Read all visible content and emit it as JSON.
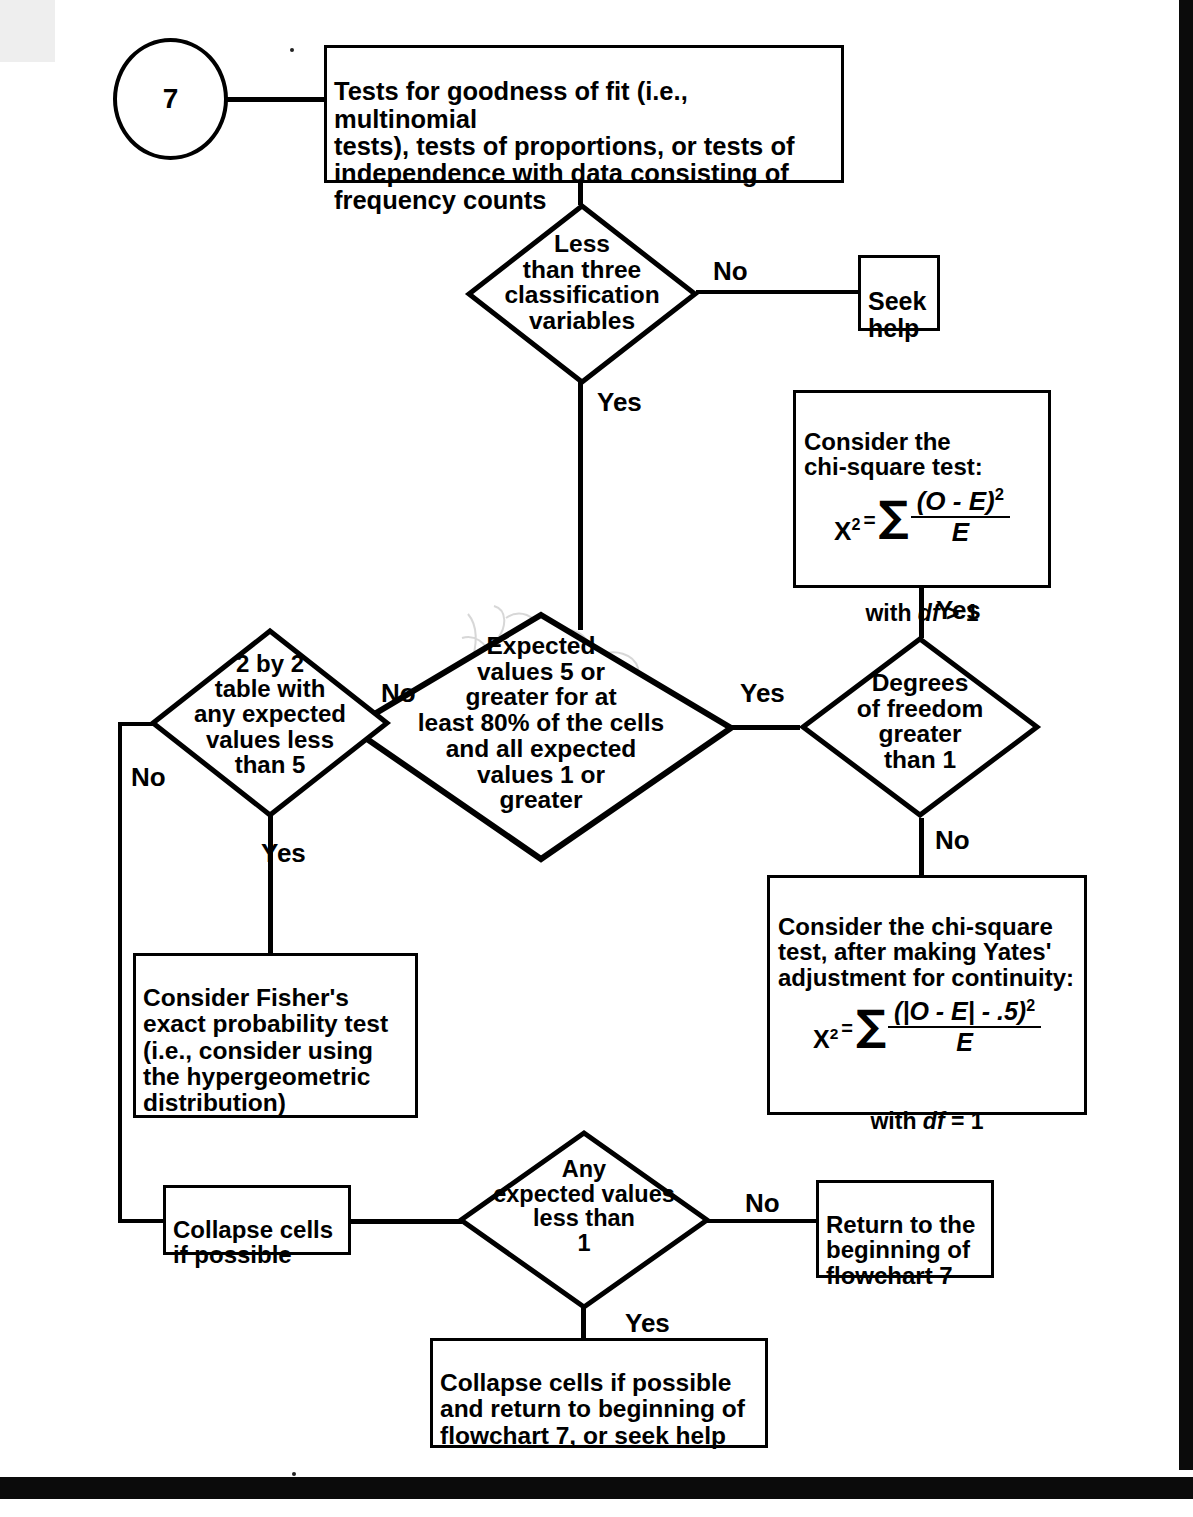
{
  "flowchart": {
    "entry": {
      "id": "7",
      "name": "flowchart-number"
    },
    "nodes": [
      {
        "key": "start_box",
        "type": "process",
        "text": "Tests for goodness of fit (i.e., multinomial\ntests), tests of proportions, or tests of\nindependence with data consisting of\nfrequency counts"
      },
      {
        "key": "d_classification",
        "type": "decision",
        "text": "Less\nthan three\nclassification\nvariables"
      },
      {
        "key": "seek_help",
        "type": "process",
        "text": "Seek\nhelp"
      },
      {
        "key": "chisq_box",
        "type": "process",
        "title": "Consider the\nchi-square test:",
        "formula": {
          "lhs": "X",
          "lhs_sup": "2",
          "equals": "=",
          "sigma": "∑",
          "numerator": "(O - E)",
          "numerator_sup": "2",
          "denominator": "E"
        },
        "footer_prefix": "with ",
        "footer_italic": "df",
        "footer_suffix": " > 1"
      },
      {
        "key": "d_expected",
        "type": "decision",
        "text": "Expected\nvalues 5 or\ngreater for at\nleast 80% of the cells\nand all expected\nvalues 1 or\ngreater"
      },
      {
        "key": "d_twobytwo",
        "type": "decision",
        "text": "2 by 2\ntable with\nany expected\nvalues less\nthan 5"
      },
      {
        "key": "d_df",
        "type": "decision",
        "text": "Degrees\nof freedom\ngreater\nthan 1"
      },
      {
        "key": "yates_box",
        "type": "process",
        "title": "Consider the chi-square\ntest, after making Yates'\nadjustment for continuity:",
        "formula": {
          "lhs": "X",
          "lhs_sup": "2",
          "equals": "=",
          "sigma": "∑",
          "numerator": "(|O - E| - .5)",
          "numerator_sup": "2",
          "denominator": "E"
        },
        "footer_prefix": "with ",
        "footer_italic": "df",
        "footer_suffix": " = 1"
      },
      {
        "key": "fisher_box",
        "type": "process",
        "text": "Consider Fisher's\nexact probability test\n(i.e., consider using\nthe hypergeometric\ndistribution)"
      },
      {
        "key": "collapse_box",
        "type": "process",
        "text": "Collapse cells\nif possible"
      },
      {
        "key": "d_anyexpected",
        "type": "decision",
        "text": "Any\nexpected values\nless than\n1"
      },
      {
        "key": "return_box",
        "type": "process",
        "text": "Return to the\nbeginning of\nflowchart 7"
      },
      {
        "key": "collapse_return_box",
        "type": "process",
        "text": "Collapse cells if possible\nand return to beginning of\nflowchart 7, or seek help"
      }
    ],
    "edge_labels": {
      "classification_no": "No",
      "classification_yes": "Yes",
      "expected_no": "No",
      "expected_yes": "Yes",
      "twobytwo_no": "No",
      "twobytwo_yes": "Yes",
      "chisq_yes": "Yes",
      "df_no": "No",
      "anyexpected_no": "No",
      "anyexpected_yes": "Yes"
    },
    "colors": {
      "stroke": "#000000",
      "fill": "#ffffff",
      "page": "#ffffff",
      "scan_artifact": "#0b0b0b"
    }
  }
}
